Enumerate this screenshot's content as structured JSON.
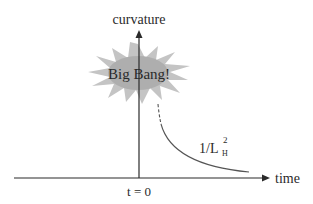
{
  "diagram": {
    "y_axis_label": "curvature",
    "x_axis_label": "time",
    "origin_label": "t = 0",
    "burst_label": "Big Bang!",
    "curve_label": {
      "base": "1/L",
      "subscript": "H",
      "superscript": "2"
    },
    "colors": {
      "axis": "#2a2a2a",
      "curve": "#555555",
      "burst_fill": "#b8b8b8",
      "burst_core": "#a8a8a8"
    }
  }
}
